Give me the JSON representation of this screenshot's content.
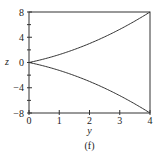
{
  "chart_data": {
    "type": "line",
    "title": "",
    "caption": "(f)",
    "xlabel": "y",
    "ylabel": "z",
    "xlim": [
      0,
      4
    ],
    "ylim": [
      -8,
      8
    ],
    "xticks": [
      "0",
      "1",
      "2",
      "3",
      "4"
    ],
    "yticks": [
      "8",
      "4",
      "0",
      "−4",
      "−8"
    ],
    "ytick_values": [
      8,
      4,
      0,
      -4,
      -8
    ],
    "minor_yticks": [
      6,
      2,
      -2,
      -6
    ],
    "grid": false,
    "legend": null,
    "series": [
      {
        "name": "upper curve",
        "x": [
          0,
          0.5,
          1,
          1.5,
          2,
          2.5,
          3,
          3.5,
          4
        ],
        "values": [
          0,
          0.56,
          1.25,
          2.06,
          3.0,
          4.06,
          5.25,
          6.56,
          8.0
        ]
      },
      {
        "name": "lower curve",
        "x": [
          0,
          0.5,
          1,
          1.5,
          2,
          2.5,
          3,
          3.5,
          4
        ],
        "values": [
          0,
          -0.56,
          -1.25,
          -2.06,
          -3.0,
          -4.06,
          -5.25,
          -6.56,
          -8.0
        ]
      }
    ],
    "line_color": "#333333"
  }
}
